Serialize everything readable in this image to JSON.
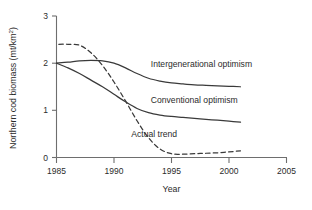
{
  "chart_data": {
    "type": "line",
    "title": "",
    "xlabel": "Year",
    "ylabel": "Northern cod biomass (mt/km2)",
    "ylabel_main": "Northern cod biomass (mt/km",
    "ylabel_sup": "2",
    "ylabel_tail": ")",
    "xlim": [
      1985,
      2005
    ],
    "ylim": [
      0,
      3
    ],
    "xticks": [
      1985,
      1990,
      1995,
      2000,
      2005
    ],
    "xtick_labels": [
      "1985",
      "1990",
      "1995",
      "2000",
      "2005"
    ],
    "yticks": [
      0,
      1,
      2,
      3
    ],
    "ytick_labels": [
      "0",
      "1",
      "2",
      "3"
    ],
    "grid": false,
    "legend_position": "inline-annotations",
    "series": [
      {
        "name": "Intergenerational optimism",
        "style": "solid",
        "label": "Intergenerational optimism",
        "x": [
          1985,
          1986,
          1987,
          1988,
          1989,
          1990,
          1991,
          1992,
          1993,
          1994,
          1995,
          1996,
          1997,
          1998,
          1999,
          2000,
          2001
        ],
        "values": [
          2.0,
          2.02,
          2.05,
          2.06,
          2.05,
          2.0,
          1.9,
          1.78,
          1.68,
          1.62,
          1.58,
          1.56,
          1.54,
          1.53,
          1.52,
          1.51,
          1.5
        ]
      },
      {
        "name": "Conventional optimism",
        "style": "solid",
        "label": "Conventional optimism",
        "x": [
          1985,
          1986,
          1987,
          1988,
          1989,
          1990,
          1991,
          1992,
          1993,
          1994,
          1995,
          1996,
          1997,
          1998,
          1999,
          2000,
          2001
        ],
        "values": [
          2.0,
          1.9,
          1.78,
          1.64,
          1.5,
          1.34,
          1.18,
          1.04,
          0.95,
          0.9,
          0.87,
          0.85,
          0.83,
          0.81,
          0.79,
          0.77,
          0.75
        ]
      },
      {
        "name": "Actual trend",
        "style": "dashed",
        "label": "Actual trend",
        "x": [
          1985.2,
          1986,
          1987,
          1988,
          1989,
          1990,
          1991,
          1992,
          1993,
          1994,
          1995,
          1996,
          1997,
          1998,
          1999,
          2000,
          2001
        ],
        "values": [
          2.4,
          2.4,
          2.38,
          2.22,
          1.95,
          1.6,
          1.2,
          0.78,
          0.42,
          0.18,
          0.08,
          0.07,
          0.08,
          0.09,
          0.1,
          0.12,
          0.14
        ]
      }
    ],
    "annotations": [
      {
        "text": "Intergenerational optimism",
        "x": 1993.2,
        "y": 1.92
      },
      {
        "text": "Conventional optimism",
        "x": 1993.2,
        "y": 1.15
      },
      {
        "text": "Actual trend",
        "x": 1991.5,
        "y": 0.43
      }
    ]
  }
}
